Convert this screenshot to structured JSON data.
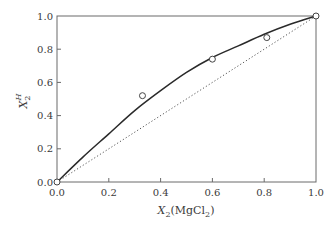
{
  "chart_data": {
    "type": "line",
    "title": "",
    "xlabel": "X2(MgCl2)",
    "ylabel": "X2^H",
    "xlabel_parts": {
      "var": "X",
      "sub": "2",
      "rest": "(MgCl",
      "rest_sub": "2",
      "close": ")"
    },
    "ylabel_parts": {
      "var": "X",
      "sub": "2",
      "sup": "H"
    },
    "xlim": [
      0.0,
      1.0
    ],
    "ylim": [
      0.0,
      1.0
    ],
    "xticks": [
      0.0,
      0.2,
      0.4,
      0.6,
      0.8,
      1.0
    ],
    "yticks": [
      0.0,
      0.2,
      0.4,
      0.6,
      0.8,
      1.0
    ],
    "xtick_labels": [
      "0.0",
      "0.2",
      "0.4",
      "0.6",
      "0.8",
      "1.0"
    ],
    "ytick_labels": [
      "0.0",
      "0.2",
      "0.4",
      "0.6",
      "0.8",
      "1.0"
    ],
    "grid": false,
    "legend": null,
    "series": [
      {
        "name": "model curve",
        "style": "solid",
        "color": "#2a2a2a",
        "x": [
          0.0,
          0.1,
          0.2,
          0.3,
          0.4,
          0.5,
          0.6,
          0.7,
          0.8,
          0.9,
          1.0
        ],
        "y": [
          0.0,
          0.15,
          0.29,
          0.43,
          0.55,
          0.66,
          0.75,
          0.82,
          0.89,
          0.95,
          1.0
        ]
      },
      {
        "name": "diagonal (ideal)",
        "style": "dotted",
        "color": "#555555",
        "x": [
          0.0,
          1.0
        ],
        "y": [
          0.0,
          1.0
        ]
      },
      {
        "name": "experimental data",
        "style": "markers",
        "marker": "open-circle",
        "color": "#444444",
        "x": [
          0.0,
          0.33,
          0.6,
          0.81,
          1.0
        ],
        "y": [
          0.0,
          0.52,
          0.74,
          0.87,
          1.0
        ]
      }
    ]
  }
}
